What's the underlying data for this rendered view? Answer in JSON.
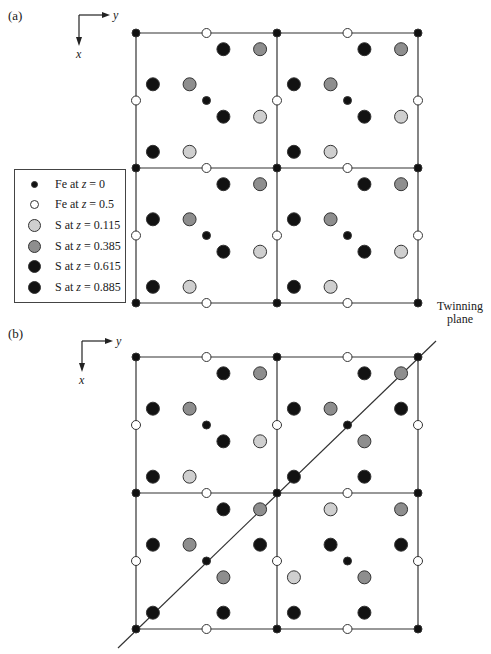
{
  "panels": [
    {
      "label": "(a)",
      "axes": {
        "x": "x",
        "y": "y"
      }
    },
    {
      "label": "(b)",
      "axes": {
        "x": "x",
        "y": "y"
      },
      "annotation": "Twinning\nplane",
      "annotation_lines": [
        "Twinning",
        "plane"
      ]
    }
  ],
  "legend": {
    "items": [
      {
        "symbol": "fe-small-black",
        "prefix": "Fe at ",
        "var": "z",
        "value": " = 0",
        "color": "#111111",
        "size": 7
      },
      {
        "symbol": "fe-open",
        "prefix": "Fe at ",
        "var": "z",
        "value": " = 0.5",
        "color": "#ffffff",
        "size": 9
      },
      {
        "symbol": "s-light-gray",
        "prefix": "S at ",
        "var": "z",
        "value": " = 0.115",
        "color": "#cfcfcf",
        "size": 13
      },
      {
        "symbol": "s-mid-gray",
        "prefix": "S at ",
        "var": "z",
        "value": " = 0.385",
        "color": "#8e8e8e",
        "size": 13
      },
      {
        "symbol": "s-black",
        "prefix": "S at ",
        "var": "z",
        "value": " = 0.615",
        "color": "#121212",
        "size": 13
      },
      {
        "symbol": "s-black",
        "prefix": "S at ",
        "var": "z",
        "value": " = 0.885",
        "color": "#121212",
        "size": 13
      }
    ]
  },
  "colors": {
    "line": "#333333",
    "fe0": "#111111",
    "fe05": "#ffffff",
    "s0115": "#cfcfcf",
    "s0385": "#8e8e8e",
    "s0615": "#121212",
    "s0885": "#121212"
  },
  "cell_patterns": {
    "normal": [
      {
        "u": 0.62,
        "v": 0.12,
        "t": "s0615"
      },
      {
        "u": 0.88,
        "v": 0.12,
        "t": "s0385"
      },
      {
        "u": 0.12,
        "v": 0.38,
        "t": "s0885"
      },
      {
        "u": 0.38,
        "v": 0.38,
        "t": "s0385"
      },
      {
        "u": 0.62,
        "v": 0.62,
        "t": "s0615"
      },
      {
        "u": 0.88,
        "v": 0.62,
        "t": "s0115"
      },
      {
        "u": 0.12,
        "v": 0.88,
        "t": "s0885"
      },
      {
        "u": 0.38,
        "v": 0.88,
        "t": "s0115"
      }
    ],
    "twinned": [
      {
        "u": 0.62,
        "v": 0.12,
        "t": "s0615"
      },
      {
        "u": 0.88,
        "v": 0.12,
        "t": "s0385"
      },
      {
        "u": 0.12,
        "v": 0.38,
        "t": "s0885"
      },
      {
        "u": 0.38,
        "v": 0.38,
        "t": "s0385"
      },
      {
        "u": 0.88,
        "v": 0.38,
        "t": "s0885"
      },
      {
        "u": 0.62,
        "v": 0.62,
        "t": "s0385"
      },
      {
        "u": 0.12,
        "v": 0.88,
        "t": "s0885"
      },
      {
        "u": 0.62,
        "v": 0.88,
        "t": "s0615"
      }
    ],
    "twinned_br": [
      {
        "u": 0.38,
        "v": 0.12,
        "t": "s0115"
      },
      {
        "u": 0.88,
        "v": 0.12,
        "t": "s0385"
      },
      {
        "u": 0.38,
        "v": 0.38,
        "t": "s0885"
      },
      {
        "u": 0.88,
        "v": 0.38,
        "t": "s0885"
      },
      {
        "u": 0.12,
        "v": 0.62,
        "t": "s0115"
      },
      {
        "u": 0.62,
        "v": 0.62,
        "t": "s0385"
      },
      {
        "u": 0.12,
        "v": 0.88,
        "t": "s0885"
      },
      {
        "u": 0.62,
        "v": 0.88,
        "t": "s0615"
      }
    ]
  },
  "grids": [
    {
      "panel": 0,
      "x0": 136,
      "y0": 33,
      "w": 141,
      "h": 135,
      "cells": [
        [
          "normal",
          "normal"
        ],
        [
          "normal",
          "normal"
        ]
      ]
    },
    {
      "panel": 1,
      "x0": 136,
      "y0": 357,
      "w": 141,
      "h": 136,
      "cells": [
        [
          "normal",
          "twinned"
        ],
        [
          "twinned",
          "twinned_br"
        ]
      ],
      "twin_line": {
        "x1": 118,
        "y1": 648,
        "x2": 436,
        "y2": 341
      }
    }
  ]
}
